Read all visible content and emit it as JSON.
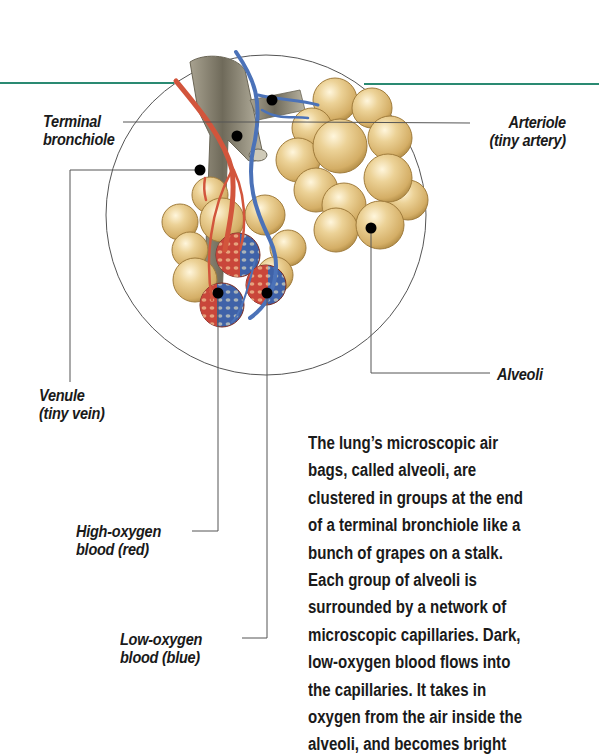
{
  "figure": {
    "accent_rule_color": "#2a8a72",
    "colors": {
      "alveoli": "#e8c98a",
      "alveoli_shadow": "#b8944f",
      "bronchiole": "#8f8a78",
      "artery_red": "#d2553c",
      "vein_blue": "#4b72b8",
      "callout_dot": "#000000",
      "leader_line": "#555555"
    }
  },
  "labels": {
    "terminal_bronchiole": [
      "Terminal",
      "bronchiole"
    ],
    "arteriole": [
      "Arteriole",
      "(tiny artery)"
    ],
    "venule": [
      "Venule",
      "(tiny vein)"
    ],
    "alveoli": [
      "Alveoli"
    ],
    "high_oxygen": [
      "High-oxygen",
      "blood (red)"
    ],
    "low_oxygen": [
      "Low-oxygen",
      "blood (blue)"
    ]
  },
  "caption": {
    "lines": [
      "The lung’s microscopic air",
      "bags, called alveoli, are",
      "clustered in groups at the end",
      "of a terminal bronchiole like a",
      "bunch of grapes on a stalk.",
      "Each group of alveoli is",
      "surrounded by a network of",
      "microscopic capillaries. Dark,",
      "low-oxygen blood flows into",
      "the capillaries. It takes in",
      "oxygen from the air inside the",
      "alveoli, and becomes bright"
    ]
  }
}
